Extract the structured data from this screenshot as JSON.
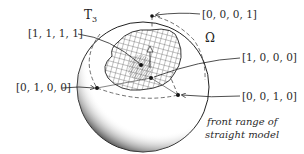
{
  "figure": {
    "sphere_label": "T",
    "sphere_label_sub": "3",
    "region_label": "Ω",
    "vertices": [
      {
        "id": "v1111",
        "label": "[1, 1, 1, 1]"
      },
      {
        "id": "v0001",
        "label": "[0, 0, 0, 1]"
      },
      {
        "id": "v1000",
        "label": "[1, 0, 0, 0]"
      },
      {
        "id": "v0100",
        "label": "[0, 1, 0, 0]"
      },
      {
        "id": "v0010",
        "label": "[0, 0, 1, 0]"
      }
    ],
    "caption_line1": "front range of",
    "caption_line2": "straight model"
  },
  "colors": {
    "ink": "#222222",
    "background": "#ffffff"
  }
}
